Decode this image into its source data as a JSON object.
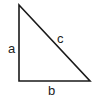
{
  "diagram": {
    "type": "right-triangle",
    "stroke_color": "#1a1a1a",
    "vertices": [
      [
        19,
        5
      ],
      [
        19,
        81
      ],
      [
        90,
        81
      ]
    ],
    "labels": {
      "a": "a",
      "b": "b",
      "c": "c"
    }
  }
}
